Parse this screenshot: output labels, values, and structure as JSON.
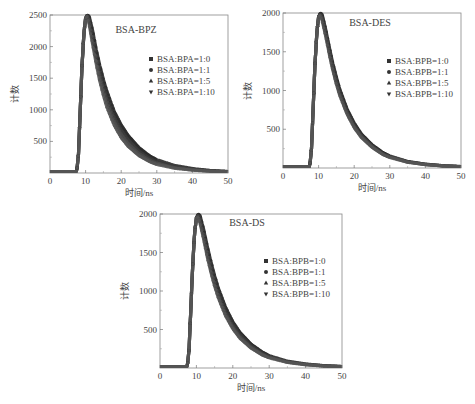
{
  "figure": {
    "ylabel": "计数",
    "xlabel": "时间/ns"
  },
  "chart_data": [
    {
      "type": "scatter",
      "title": "BSA-BPZ",
      "xlabel": "时间/ns",
      "ylabel": "计数",
      "xlim": [
        0,
        50
      ],
      "ylim": [
        0,
        2500
      ],
      "xticks": [
        0,
        10,
        20,
        30,
        40,
        50
      ],
      "yticks": [
        500,
        1000,
        1500,
        2000,
        2500
      ],
      "legend_position": "center-right",
      "grid": false,
      "x": [
        0,
        5,
        7.5,
        8,
        8.5,
        9,
        9.5,
        10,
        10.5,
        11,
        12,
        13,
        14,
        15,
        16,
        18,
        20,
        22,
        25,
        28,
        30,
        35,
        40,
        45,
        50
      ],
      "series": [
        {
          "name": "BSA:BPA=1:0",
          "marker": "square",
          "values": [
            20,
            20,
            25,
            300,
            1000,
            1700,
            2200,
            2450,
            2500,
            2480,
            2250,
            1950,
            1700,
            1480,
            1290,
            980,
            760,
            590,
            400,
            270,
            210,
            120,
            70,
            40,
            25
          ]
        },
        {
          "name": "BSA:BPA=1:1",
          "marker": "circle",
          "values": [
            20,
            20,
            25,
            300,
            1000,
            1700,
            2200,
            2450,
            2500,
            2450,
            2180,
            1880,
            1620,
            1400,
            1210,
            900,
            690,
            530,
            350,
            235,
            180,
            100,
            60,
            35,
            22
          ]
        },
        {
          "name": "BSA:BPA=1:5",
          "marker": "triangle-up",
          "values": [
            20,
            20,
            25,
            300,
            1000,
            1700,
            2200,
            2450,
            2490,
            2400,
            2100,
            1800,
            1530,
            1310,
            1120,
            830,
            620,
            470,
            310,
            205,
            155,
            85,
            50,
            30,
            20
          ]
        },
        {
          "name": "BSA:BPA=1:10",
          "marker": "triangle-down",
          "values": [
            20,
            20,
            25,
            300,
            1000,
            1700,
            2200,
            2450,
            2480,
            2350,
            2030,
            1720,
            1450,
            1230,
            1040,
            760,
            560,
            420,
            275,
            180,
            135,
            75,
            45,
            27,
            18
          ]
        }
      ]
    },
    {
      "type": "scatter",
      "title": "BSA-DES",
      "xlabel": "时间/ns",
      "ylabel": "计数",
      "xlim": [
        0,
        50
      ],
      "ylim": [
        0,
        2000
      ],
      "xticks": [
        0,
        10,
        20,
        30,
        40,
        50
      ],
      "yticks": [
        500,
        1000,
        1500,
        2000
      ],
      "legend_position": "center-right",
      "grid": false,
      "x": [
        0,
        5,
        7.5,
        8,
        8.5,
        9,
        9.5,
        10,
        10.5,
        11,
        12,
        13,
        14,
        15,
        16,
        18,
        20,
        22,
        25,
        28,
        30,
        35,
        40,
        45,
        50
      ],
      "series": [
        {
          "name": "BSA:BPB=1:0",
          "marker": "square",
          "values": [
            15,
            15,
            20,
            250,
            800,
            1350,
            1750,
            1950,
            2000,
            1980,
            1790,
            1560,
            1350,
            1170,
            1010,
            760,
            580,
            440,
            300,
            200,
            155,
            85,
            50,
            30,
            20
          ]
        },
        {
          "name": "BSA:BPB=1:1",
          "marker": "circle",
          "values": [
            15,
            15,
            20,
            250,
            800,
            1350,
            1750,
            1950,
            1990,
            1960,
            1760,
            1530,
            1320,
            1140,
            985,
            740,
            560,
            425,
            290,
            190,
            148,
            80,
            47,
            28,
            18
          ]
        },
        {
          "name": "BSA:BPB=1:5",
          "marker": "triangle-up",
          "values": [
            15,
            15,
            20,
            250,
            800,
            1350,
            1750,
            1950,
            1980,
            1930,
            1730,
            1500,
            1290,
            1110,
            955,
            715,
            540,
            410,
            278,
            183,
            142,
            77,
            45,
            27,
            17
          ]
        },
        {
          "name": "BSA:BPB=1:10",
          "marker": "triangle-down",
          "values": [
            15,
            15,
            20,
            250,
            800,
            1350,
            1750,
            1950,
            1970,
            1900,
            1700,
            1470,
            1260,
            1080,
            930,
            695,
            522,
            395,
            268,
            176,
            136,
            74,
            43,
            26,
            16
          ]
        }
      ]
    },
    {
      "type": "scatter",
      "title": "BSA-DS",
      "xlabel": "时间/ns",
      "ylabel": "计数",
      "xlim": [
        0,
        50
      ],
      "ylim": [
        0,
        2000
      ],
      "xticks": [
        0,
        10,
        20,
        30,
        40,
        50
      ],
      "yticks": [
        500,
        1000,
        1500,
        2000
      ],
      "legend_position": "center-right",
      "grid": false,
      "x": [
        0,
        5,
        7.5,
        8,
        8.5,
        9,
        9.5,
        10,
        10.5,
        11,
        12,
        13,
        14,
        15,
        16,
        18,
        20,
        22,
        25,
        28,
        30,
        35,
        40,
        45,
        50
      ],
      "series": [
        {
          "name": "BSA:BPB=1:0",
          "marker": "square",
          "values": [
            15,
            15,
            20,
            250,
            800,
            1350,
            1750,
            1950,
            2000,
            1980,
            1800,
            1580,
            1380,
            1200,
            1040,
            790,
            600,
            460,
            310,
            210,
            160,
            88,
            52,
            31,
            20
          ]
        },
        {
          "name": "BSA:BPB=1:1",
          "marker": "circle",
          "values": [
            15,
            15,
            20,
            250,
            800,
            1350,
            1750,
            1950,
            1990,
            1950,
            1760,
            1530,
            1330,
            1150,
            995,
            750,
            570,
            435,
            295,
            198,
            152,
            83,
            49,
            29,
            19
          ]
        },
        {
          "name": "BSA:BPB=1:5",
          "marker": "triangle-up",
          "values": [
            15,
            15,
            20,
            250,
            800,
            1350,
            1750,
            1950,
            1980,
            1910,
            1710,
            1480,
            1280,
            1100,
            950,
            710,
            535,
            405,
            275,
            183,
            140,
            77,
            45,
            27,
            17
          ]
        },
        {
          "name": "BSA:BPB=1:10",
          "marker": "triangle-down",
          "values": [
            15,
            15,
            20,
            250,
            800,
            1350,
            1750,
            1950,
            1960,
            1880,
            1670,
            1440,
            1240,
            1065,
            915,
            680,
            510,
            385,
            260,
            172,
            132,
            72,
            42,
            25,
            16
          ]
        }
      ]
    }
  ],
  "layout": [
    {
      "plot": {
        "left": 50,
        "top": 15,
        "right": 228,
        "bottom": 173
      },
      "title_pos": [
        136,
        33
      ],
      "legend_pos": [
        151,
        62
      ]
    },
    {
      "plot": {
        "left": 283,
        "top": 13,
        "right": 461,
        "bottom": 168
      },
      "title_pos": [
        370,
        26
      ],
      "legend_pos": [
        389,
        64
      ]
    },
    {
      "plot": {
        "left": 160,
        "top": 214,
        "right": 342,
        "bottom": 368
      },
      "title_pos": [
        247,
        226
      ],
      "legend_pos": [
        266,
        264
      ]
    }
  ]
}
